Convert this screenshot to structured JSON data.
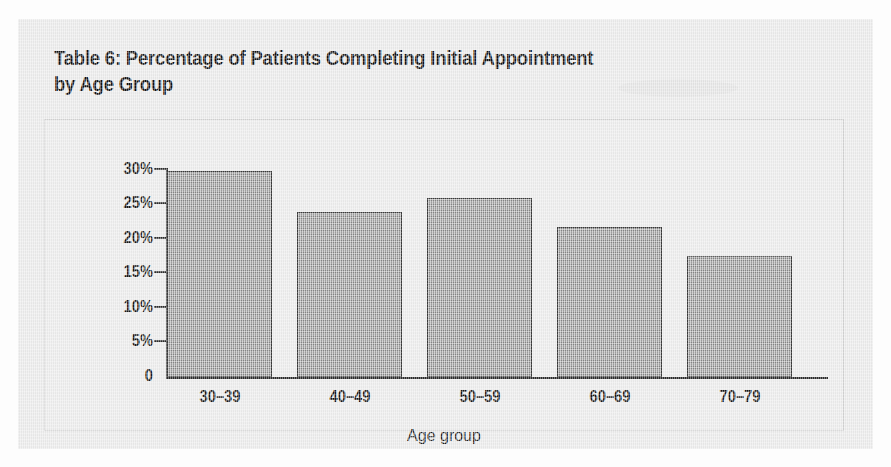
{
  "title": {
    "line1": "Table 6: Percentage of Patients Completing Initial Appointment",
    "line2": "by Age Group",
    "full": "Table 6: Percentage of Patients Completing Initial Appointment by Age Group"
  },
  "colors": {
    "page_background": "#fdfdfd",
    "paper_background": "#ebebeb",
    "chart_panel": "#ececec",
    "chart_panel_border": "#d2d2d2",
    "bar_fill": "#a0a0a0",
    "bar_border": "#3a3a3a",
    "axis": "#2b2b2b",
    "text": "#161616"
  },
  "chart_data": {
    "type": "bar",
    "title": "Table 6: Percentage of Patients Completing Initial Appointment by Age Group",
    "subtitle": "",
    "xlabel": "Age group",
    "ylabel": "",
    "categories": [
      "30–39",
      "40–49",
      "50–59",
      "60–69",
      "70–79"
    ],
    "values": [
      29.9,
      23.9,
      25.9,
      21.7,
      17.6
    ],
    "value_unit": "%",
    "ylim": [
      0,
      30
    ],
    "ytick_values": [
      0,
      5,
      10,
      15,
      20,
      25,
      30
    ],
    "ytick_labels": [
      "0",
      "5%",
      "10%",
      "15%",
      "20%",
      "25%",
      "30%"
    ],
    "grid": false,
    "legend": null,
    "legend_position": "none",
    "series": [
      {
        "name": "Percentage of patients completing initial appointment",
        "values": [
          29.9,
          23.9,
          25.9,
          21.7,
          17.6
        ]
      }
    ],
    "annotations": []
  }
}
